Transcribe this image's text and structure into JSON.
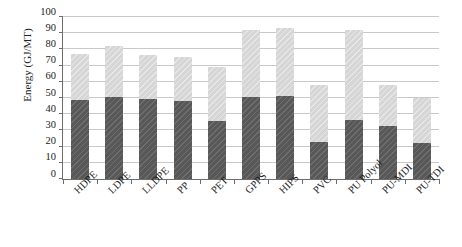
{
  "chart_data": {
    "type": "bar",
    "subtype": "stacked-bar",
    "title": "",
    "xlabel": "",
    "ylabel": "Energy (GJ/MT)",
    "ylim": [
      0,
      100
    ],
    "ytick_step": 10,
    "yticks": [
      0,
      10,
      20,
      30,
      40,
      50,
      60,
      70,
      80,
      90,
      100
    ],
    "ytick_labels": [
      "0",
      "10",
      "20",
      "30",
      "40",
      "50",
      "60",
      "70",
      "80",
      "90",
      "100"
    ],
    "grid": true,
    "grid_axis": "y",
    "legend": null,
    "categories": [
      "HDPE",
      "LDPE",
      "LLDPE",
      "PP",
      "PET",
      "GPPS",
      "HIPS",
      "PVC",
      "PU Polyol",
      "PU-MDI",
      "PU-TDI"
    ],
    "series": [
      {
        "name": "lower-segment",
        "color": "#585858",
        "values": [
          49,
          50.5,
          49.5,
          48,
          36,
          50.5,
          51,
          23,
          36.5,
          33,
          22
        ]
      },
      {
        "name": "upper-segment",
        "color": "#d6d6d6",
        "values": [
          28,
          31.5,
          27,
          27.5,
          33,
          41.5,
          42,
          35,
          55.5,
          25,
          28
        ]
      }
    ],
    "totals": [
      77,
      82,
      76.5,
      75.5,
      69,
      92,
      93,
      58,
      92,
      58,
      50
    ]
  },
  "colors": {
    "axis": "#6d6d6d",
    "grid": "#c9c9c9",
    "bar_lower": "#585858",
    "bar_upper": "#d6d6d6",
    "text": "#1a1a1a",
    "background": "#ffffff"
  }
}
